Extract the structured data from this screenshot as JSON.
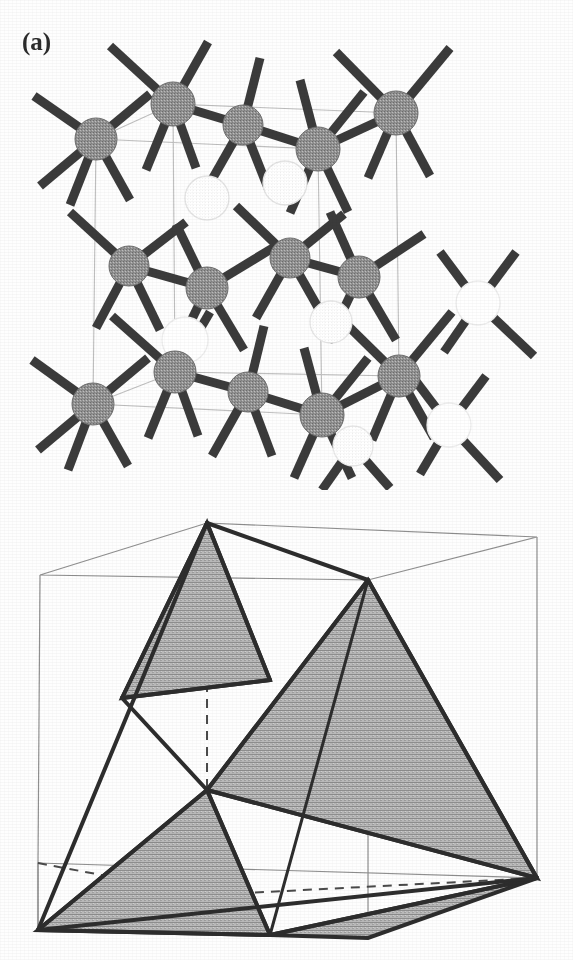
{
  "figure": {
    "background_color": "#fefefe",
    "panels": [
      {
        "id": "a",
        "label": "(a)",
        "caption_text": "",
        "kind": "crystal-structure",
        "description_name": "diamond-cubic-lattice",
        "atom_fill_color": "#8c8c8c",
        "atom_outline_color": "#6e6e6e",
        "open_atom_fill_color": "#ffffff",
        "open_atom_outline_color": "#e2e2e2",
        "bond_color": "#3a3a3a",
        "cell_edge_color": "#b9b9b9",
        "atom_radius": 21,
        "bond_width": 9,
        "atoms_filled": [
          {
            "x": 96,
            "y": 139,
            "r": 21
          },
          {
            "x": 173,
            "y": 104,
            "r": 22
          },
          {
            "x": 243,
            "y": 125,
            "r": 20
          },
          {
            "x": 318,
            "y": 149,
            "r": 22
          },
          {
            "x": 396,
            "y": 113,
            "r": 22
          },
          {
            "x": 129,
            "y": 266,
            "r": 20
          },
          {
            "x": 207,
            "y": 288,
            "r": 21
          },
          {
            "x": 290,
            "y": 258,
            "r": 20
          },
          {
            "x": 359,
            "y": 277,
            "r": 21
          },
          {
            "x": 93,
            "y": 404,
            "r": 21
          },
          {
            "x": 175,
            "y": 372,
            "r": 21
          },
          {
            "x": 248,
            "y": 392,
            "r": 20
          },
          {
            "x": 322,
            "y": 415,
            "r": 22
          },
          {
            "x": 399,
            "y": 376,
            "r": 21
          }
        ],
        "atoms_open": [
          {
            "x": 207,
            "y": 198,
            "r": 22
          },
          {
            "x": 285,
            "y": 183,
            "r": 22
          },
          {
            "x": 185,
            "y": 340,
            "r": 23
          },
          {
            "x": 331,
            "y": 322,
            "r": 21
          },
          {
            "x": 478,
            "y": 303,
            "r": 22
          },
          {
            "x": 449,
            "y": 425,
            "r": 22
          },
          {
            "x": 353,
            "y": 446,
            "r": 20
          }
        ],
        "unit_cell_vertices": {
          "top_back_left": {
            "x": 96,
            "y": 139
          },
          "top_front_left": {
            "x": 173,
            "y": 104
          },
          "top_front_right": {
            "x": 396,
            "y": 113
          },
          "top_back_right": {
            "x": 318,
            "y": 149
          },
          "bot_back_left": {
            "x": 93,
            "y": 404
          },
          "bot_front_left": {
            "x": 175,
            "y": 372
          },
          "bot_front_right": {
            "x": 399,
            "y": 376
          },
          "bot_back_right": {
            "x": 322,
            "y": 415
          }
        }
      },
      {
        "id": "b",
        "label": "(b)",
        "caption_text": "",
        "kind": "tetrahedra-in-cube",
        "description_name": "shaded-tetrahedra-in-cube",
        "shade_fill_color": "#a8a8a8",
        "shade_outline_color": "#2d2d2d",
        "cube_edge_color": "#8f8f8f",
        "hidden_edge_color": "#4a4a4a",
        "hidden_edge_dash": "9 7",
        "thick_edge_width": 4,
        "cube_edge_width": 1.2,
        "shaded_triangle_count": 4,
        "cube_vertices": {
          "top_back_left": {
            "x": 40,
            "y": 575
          },
          "top_front_left": {
            "x": 207,
            "y": 523
          },
          "top_front_right": {
            "x": 537,
            "y": 537
          },
          "top_back_right": {
            "x": 368,
            "y": 580
          },
          "bot_back_left": {
            "x": 38,
            "y": 863
          },
          "bot_front_left": {
            "x": 38,
            "y": 930
          },
          "bot_front_right": {
            "x": 368,
            "y": 938
          },
          "bot_back_right": {
            "x": 537,
            "y": 878
          }
        }
      }
    ]
  }
}
